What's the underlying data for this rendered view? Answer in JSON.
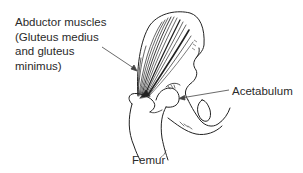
{
  "figure": {
    "type": "anatomical illustration",
    "line_color": "#222222",
    "background": "#ffffff"
  },
  "labels": {
    "abductor": {
      "line1": "Abductor muscles",
      "line2": "(Gluteus medius",
      "line3": "and gluteus",
      "line4": "minimus)"
    },
    "acetabulum": "Acetabulum",
    "femur": "Femur"
  }
}
